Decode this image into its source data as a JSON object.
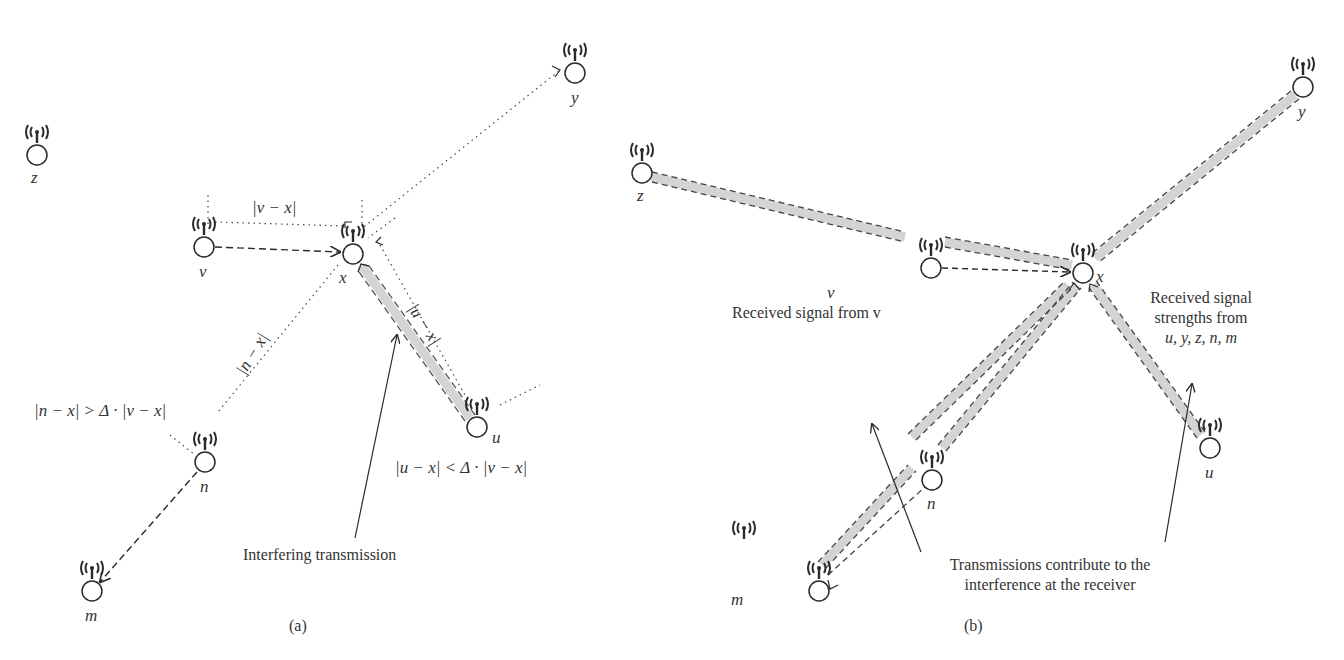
{
  "panels": [
    {
      "id": "a",
      "caption": "(a)",
      "nodes": [
        {
          "name": "z",
          "x": 37,
          "y": 155
        },
        {
          "name": "y",
          "x": 575,
          "y": 73
        },
        {
          "name": "v",
          "x": 204,
          "y": 247
        },
        {
          "name": "x",
          "x": 353,
          "y": 254
        },
        {
          "name": "u",
          "x": 477,
          "y": 427
        },
        {
          "name": "n",
          "x": 205,
          "y": 462
        },
        {
          "name": "m",
          "x": 92,
          "y": 591
        }
      ],
      "distance_labels": {
        "v_x": "|v − x|",
        "u_x": "|u − x|",
        "n_x": "|n − x|"
      },
      "conditions": {
        "n": "|n − x| > Δ · |v − x|",
        "u": "|u − x| < Δ · |v − x|"
      },
      "annotation": "Interfering transmission"
    },
    {
      "id": "b",
      "caption": "(b)",
      "nodes": [
        {
          "name": "z",
          "x": 642,
          "y": 173
        },
        {
          "name": "y",
          "x": 1303,
          "y": 87
        },
        {
          "name": "v",
          "x": 931,
          "y": 268
        },
        {
          "name": "x",
          "x": 1083,
          "y": 273
        },
        {
          "name": "u",
          "x": 1210,
          "y": 448
        },
        {
          "name": "n",
          "x": 932,
          "y": 480
        },
        {
          "name": "m",
          "x": 819,
          "y": 591
        }
      ],
      "annotations": {
        "received_from_v": "Received signal from v",
        "received_strengths_line1": "Received signal",
        "received_strengths_line2": "strengths from",
        "received_strengths_line3": "u, y, z, n, m",
        "contribute_line1": "Transmissions contribute to the",
        "contribute_line2": "interference at the receiver"
      }
    }
  ],
  "colors": {
    "ink": "#2a2a2a",
    "band": "#d4d4d4",
    "background": "#ffffff"
  }
}
